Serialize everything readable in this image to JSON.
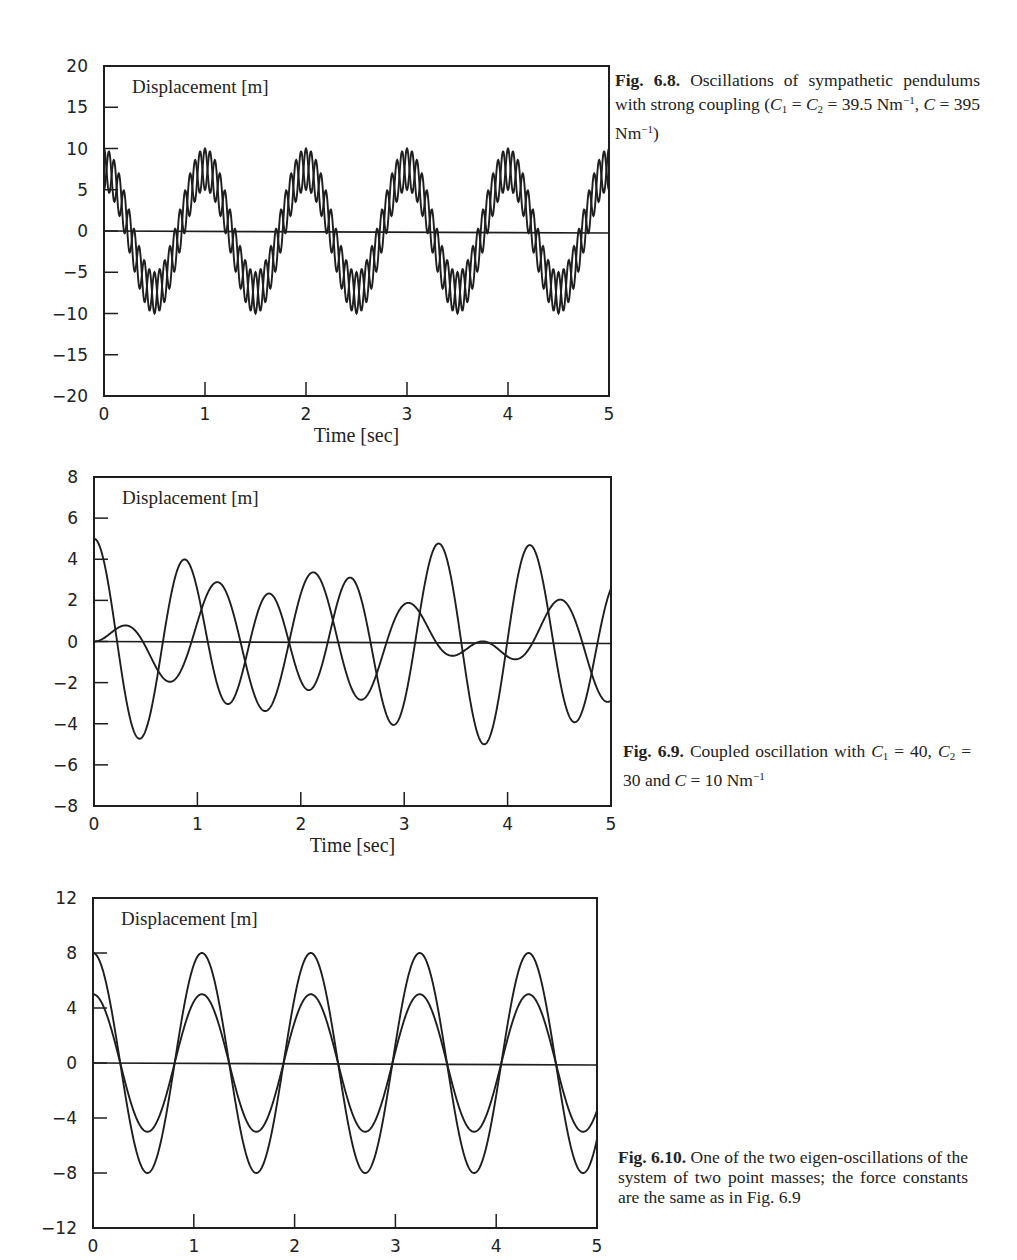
{
  "figures": [
    {
      "id": "fig-6-8",
      "caption": {
        "label": "Fig. 6.8.",
        "text_html": "Oscillations of sympathetic pendulums with strong coupling (<span class=\"sym\">C</span><sub>1</sub> = <span class=\"sym\">C</span><sub>2</sub> = 39.5 Nm<sup>−1</sup>, <span class=\"sym\">C</span> = 395 Nm<sup>−1</sup>)"
      }
    },
    {
      "id": "fig-6-9",
      "caption": {
        "label": "Fig. 6.9.",
        "text_html": "Coupled oscillation with <span class=\"sym\">C</span><sub>1</sub> = 40, <span class=\"sym\">C</span><sub>2</sub> = 30 and <span class=\"sym\">C</span> = 10 Nm<sup>−1</sup>"
      }
    },
    {
      "id": "fig-6-10",
      "caption": {
        "label": "Fig. 6.10.",
        "text_html": "One of the two eigen-oscillations of the system of two point masses; the force constants are the same as in Fig. 6.9"
      }
    }
  ],
  "chart_data": [
    {
      "type": "line",
      "title": "Fig. 6.8. Oscillations of sympathetic pendulums with strong coupling",
      "inner_label": "Displacement [m]",
      "xlabel": "Time [sec]",
      "ylabel": "Displacement [m]",
      "xlim": [
        0,
        5
      ],
      "ylim": [
        -20,
        20
      ],
      "xticks": [
        0,
        1,
        2,
        3,
        4,
        5
      ],
      "yticks": [
        20,
        15,
        10,
        5,
        0,
        -5,
        -10,
        -15,
        -20
      ],
      "grid": false,
      "zero_line": true,
      "box": {
        "left": 104,
        "right": 609,
        "top": 66,
        "bottom": 396
      },
      "series": [
        {
          "name": "pendulum 1",
          "model": "7.5*cos(2*pi*1.0*t) + 2.5*cos(2*pi*10.0*t)",
          "x0": 10
        },
        {
          "name": "pendulum 2",
          "model": "7.5*cos(2*pi*1.0*t) - 2.5*cos(2*pi*10.0*t)",
          "x0": 5
        }
      ],
      "components": [
        {
          "amp": 7.5,
          "omega": 6.2832,
          "signs": [
            1,
            1
          ]
        },
        {
          "amp": 2.5,
          "omega": 62.832,
          "signs": [
            1,
            -1
          ]
        }
      ],
      "annotations": {
        "peak_approx": 10,
        "trough_approx": -10
      }
    },
    {
      "type": "line",
      "title": "Fig. 6.9. Coupled oscillation with C1 = 40, C2 = 30 and C = 10 Nm^-1",
      "inner_label": "Displacement [m]",
      "xlabel": "Time [sec]",
      "ylabel": "Displacement [m]",
      "xlim": [
        0,
        5
      ],
      "ylim": [
        -8,
        8
      ],
      "xticks": [
        0,
        1,
        2,
        3,
        4,
        5
      ],
      "yticks": [
        8,
        6,
        4,
        2,
        0,
        -2,
        -4,
        -6,
        -8
      ],
      "grid": false,
      "zero_line": true,
      "box": {
        "left": 94,
        "right": 611,
        "top": 477,
        "bottom": 806
      },
      "series": [
        {
          "name": "mass 1",
          "x0": 5,
          "peaks_approx": [
            [
              0.0,
              5.0
            ],
            [
              0.9,
              3.9
            ],
            [
              2.15,
              4.2
            ],
            [
              3.35,
              4.5
            ],
            [
              4.25,
              4.4
            ]
          ],
          "troughs_approx": [
            [
              0.45,
              -4.6
            ],
            [
              1.65,
              -4.4
            ],
            [
              2.9,
              -4.1
            ],
            [
              3.8,
              -5.1
            ],
            [
              4.65,
              -4.1
            ]
          ]
        },
        {
          "name": "mass 2",
          "x0": 0,
          "peaks_approx": [
            [
              0.3,
              1.0
            ],
            [
              1.2,
              3.6
            ],
            [
              2.5,
              2.9
            ],
            [
              3.05,
              2.2
            ],
            [
              4.55,
              2.3
            ]
          ],
          "troughs_approx": [
            [
              0.75,
              -2.5
            ],
            [
              1.3,
              -3.1
            ],
            [
              2.0,
              -2.4
            ],
            [
              2.6,
              -3.7
            ],
            [
              3.5,
              -1.1
            ],
            [
              4.1,
              -1.3
            ]
          ]
        }
      ],
      "components": [
        {
          "amp1": 1.38,
          "amp2": 1.72,
          "omega": 5.816
        },
        {
          "amp1": 3.62,
          "amp2": -1.72,
          "omega": 7.495
        }
      ]
    },
    {
      "type": "line",
      "title": "Fig. 6.10. One of the two eigen-oscillations of the system of two point masses",
      "inner_label": "Displacement [m]",
      "xlabel": "",
      "ylabel": "Displacement [m]",
      "xlim": [
        0,
        5
      ],
      "ylim": [
        -12,
        12
      ],
      "xticks": [
        0,
        1,
        2,
        3,
        4,
        5
      ],
      "yticks": [
        12,
        8,
        4,
        0,
        -4,
        -8,
        -12
      ],
      "grid": false,
      "zero_line": true,
      "box": {
        "left": 93,
        "right": 597,
        "top": 898,
        "bottom": 1228
      },
      "series": [
        {
          "name": "mass 1",
          "amplitude": 8,
          "x0": 8
        },
        {
          "name": "mass 2",
          "amplitude": 5,
          "x0": 5
        }
      ],
      "components": [
        {
          "amp1": 8,
          "amp2": 5,
          "omega": 5.816
        }
      ],
      "period_sec": 1.08
    }
  ]
}
